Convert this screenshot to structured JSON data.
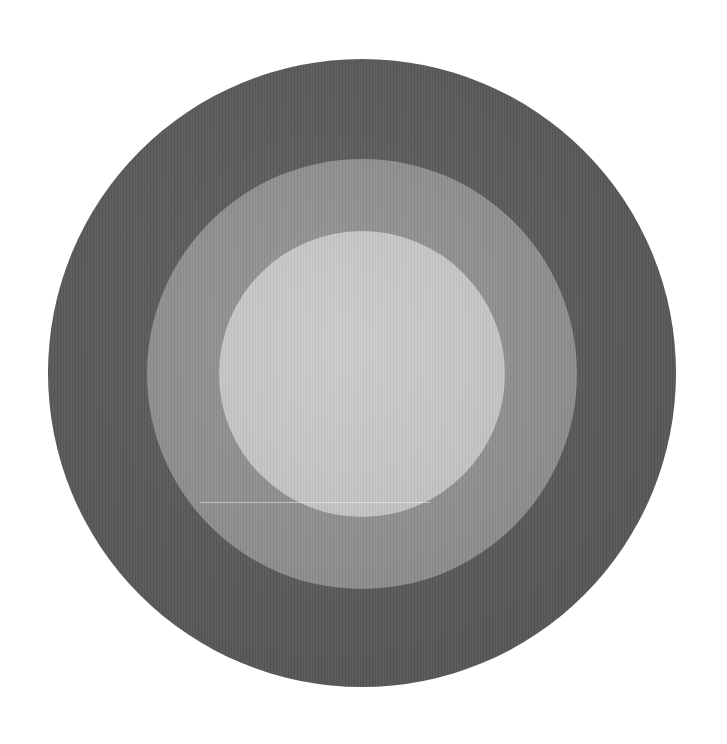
{
  "image": {
    "subject": "concentric circles",
    "background_color": "#ffffff",
    "rings": [
      {
        "name": "outer",
        "color": "#5a5a5a",
        "center": [
          362,
          373
        ],
        "radius": 314
      },
      {
        "name": "middle",
        "color": "#8e8e8e",
        "center": [
          362,
          374
        ],
        "radius": 215
      },
      {
        "name": "inner",
        "color": "#c4c4c4",
        "center": [
          362,
          374
        ],
        "radius": 143
      }
    ]
  }
}
